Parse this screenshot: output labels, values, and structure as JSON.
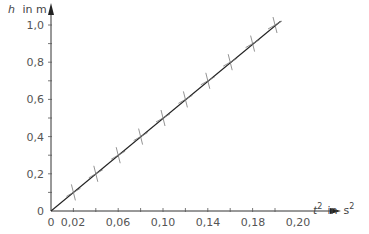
{
  "chart_data": {
    "type": "scatter",
    "title": "",
    "xlabel": "t² in s²",
    "ylabel": "h in m",
    "x_tick_labels": [
      "0",
      "0,02",
      "0,06",
      "0,10",
      "0,14",
      "0,18",
      "0,20"
    ],
    "y_tick_labels": [
      "0",
      "0,2",
      "0,4",
      "0,6",
      "0,8",
      "1,0"
    ],
    "xlim": [
      0,
      0.22
    ],
    "ylim": [
      0,
      1.05
    ],
    "grid": false,
    "legend": null,
    "series": [
      {
        "name": "measurements",
        "marker": "cross",
        "x": [
          0.02,
          0.04,
          0.06,
          0.08,
          0.1,
          0.12,
          0.14,
          0.16,
          0.18,
          0.2
        ],
        "y": [
          0.1,
          0.2,
          0.3,
          0.4,
          0.5,
          0.6,
          0.7,
          0.8,
          0.9,
          1.0
        ]
      },
      {
        "name": "fit line",
        "marker": "none",
        "x": [
          0,
          0.205
        ],
        "y": [
          0,
          1.02
        ]
      }
    ]
  },
  "labels": {
    "y_axis_var": "h",
    "y_axis_unit": "in  m",
    "x_axis_var": "t",
    "x_axis_exp": "2",
    "x_axis_in": "in",
    "x_axis_unit": "s",
    "x_axis_unit_exp": "2"
  }
}
